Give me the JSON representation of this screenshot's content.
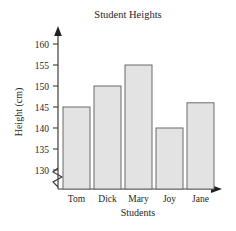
{
  "chart_data": {
    "type": "bar",
    "title": "Student Heights",
    "xlabel": "Students",
    "ylabel": "Height (cm)",
    "categories": [
      "Tom",
      "Dick",
      "Mary",
      "Joy",
      "Jane"
    ],
    "values": [
      145,
      150,
      155,
      140,
      146
    ],
    "ylim": [
      130,
      162
    ],
    "yticks": [
      130,
      135,
      140,
      145,
      150,
      155,
      160
    ],
    "ytick_labels": [
      "130",
      "135",
      "140",
      "145",
      "150",
      "155",
      "160"
    ],
    "grid": false,
    "legend": false,
    "axis_break": true,
    "axis_break_note": "zigzag break on vertical axis below 130",
    "bar_fill_color": "#e3e3e3",
    "bar_edge_color": "#6b6b6b",
    "axis_color": "#3d3d3d",
    "text_color": "#262626"
  },
  "labels": {
    "title": "Student Heights",
    "x_axis_title": "Students",
    "y_axis_title": "Height (cm)",
    "y_tick_160": "160",
    "y_tick_155": "155",
    "y_tick_150": "150",
    "y_tick_145": "145",
    "y_tick_140": "140",
    "y_tick_135": "135",
    "y_tick_130": "130",
    "cat_0": "Tom",
    "cat_1": "Dick",
    "cat_2": "Mary",
    "cat_3": "Joy",
    "cat_4": "Jane"
  }
}
